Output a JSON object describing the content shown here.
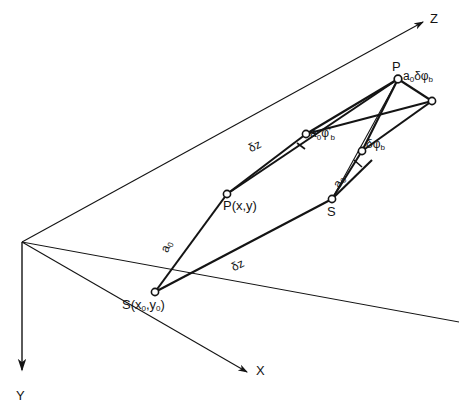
{
  "figure": {
    "kind": "3d-coordinate-geometry-diagram",
    "background_color": "#ffffff",
    "line_color": "#141414",
    "axes": [
      {
        "name": "Z",
        "label": "Z",
        "direction": "upper-right"
      },
      {
        "name": "X",
        "label": "X",
        "direction": "lower-right"
      },
      {
        "name": "Y",
        "label": "Y",
        "direction": "down"
      }
    ],
    "points": [
      {
        "id": "S0",
        "label": "S(x₀,y₀)",
        "label_text": "S(x0,y0)"
      },
      {
        "id": "P0",
        "label": "P(x,y)"
      },
      {
        "id": "S1",
        "label": "S"
      },
      {
        "id": "P1",
        "label": "P"
      }
    ],
    "measurements": [
      {
        "id": "dz-lower",
        "label": "δz"
      },
      {
        "id": "dz-upper",
        "label": "δz"
      },
      {
        "id": "a0-lower-left",
        "label": "a₀"
      },
      {
        "id": "a0-upper-right",
        "label": "a₀"
      },
      {
        "id": "arc-mid",
        "label": "a₀φ'b"
      },
      {
        "id": "arc-right",
        "label": "δφb"
      },
      {
        "id": "arc-top",
        "label": "a₀δφb"
      }
    ],
    "label_parts": {
      "axis_z": "Z",
      "axis_x": "X",
      "axis_y": "Y",
      "point_s0_main": "S(x",
      "point_s0_sub1": "0",
      "point_s0_mid": ",y",
      "point_s0_sub2": "0",
      "point_s0_end": ")",
      "point_p0": "P(x,y)",
      "point_s1": "S",
      "point_p1": "P",
      "dz_lower": "δz",
      "dz_upper": "δz",
      "a0_left_main": "a",
      "a0_left_sub": "0",
      "a0_right_main": "a",
      "a0_right_sub": "0",
      "arc_top_a": "a",
      "arc_top_a_sub": "0",
      "arc_top_delta": "δ",
      "arc_top_phi": "φ",
      "arc_top_phi_sub": "b",
      "arc_mid_a": "a",
      "arc_mid_a_sub": "0",
      "arc_mid_phi": "φ",
      "arc_mid_prime": "′",
      "arc_mid_phi_sub": "b",
      "arc_right_delta": "δ",
      "arc_right_phi": "φ",
      "arc_right_phi_sub": "b"
    },
    "cropped_header_artifact": "·        ·           ·"
  }
}
